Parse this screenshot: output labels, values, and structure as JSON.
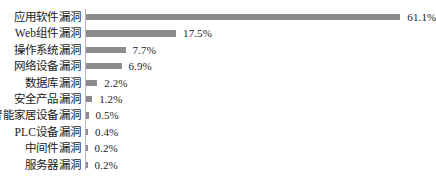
{
  "chart_data": {
    "type": "bar",
    "orientation": "horizontal",
    "title": "",
    "subtitle": "",
    "xlabel": "",
    "ylabel": "",
    "grid": false,
    "legend": false,
    "legend_position": "none",
    "xlim": [
      0,
      61.1
    ],
    "value_suffix": "%",
    "bar_color": "#8c8c8c",
    "text_color": "#1a1a1a",
    "axis_color": "#b6b6b6",
    "background_color": "#ffffff",
    "categories": [
      "应用软件漏洞",
      "Web组件漏洞",
      "操作系统漏洞",
      "网络设备漏洞",
      "数据库漏洞",
      "安全产品漏洞",
      "智能家居设备漏洞",
      "PLC设备漏洞",
      "中间件漏洞",
      "服务器漏洞"
    ],
    "values": [
      61.1,
      17.5,
      7.7,
      6.9,
      2.2,
      1.2,
      0.5,
      0.4,
      0.2,
      0.2
    ],
    "value_labels": [
      "61.1%",
      "17.5%",
      "7.7%",
      "6.9%",
      "2.2%",
      "1.2%",
      "0.5%",
      "0.4%",
      "0.2%",
      "0.2%"
    ]
  }
}
